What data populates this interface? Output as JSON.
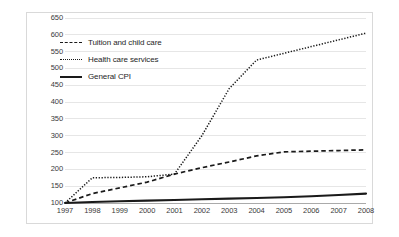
{
  "chart_data": {
    "type": "line",
    "title": "",
    "xlabel": "",
    "ylabel": "",
    "x": [
      1997,
      1998,
      1999,
      2000,
      2001,
      2002,
      2003,
      2004,
      2005,
      2006,
      2007,
      2008
    ],
    "categories": [
      "1997",
      "1998",
      "1999",
      "2000",
      "2001",
      "2002",
      "2003",
      "2004",
      "2005",
      "2006",
      "2007",
      "2008"
    ],
    "xlim": [
      1997,
      2008
    ],
    "ylim": [
      100,
      650
    ],
    "ytick_labels": [
      "100",
      "150",
      "200",
      "250",
      "300",
      "350",
      "400",
      "450",
      "500",
      "550",
      "600",
      "650"
    ],
    "ytick_values": [
      100,
      150,
      200,
      250,
      300,
      350,
      400,
      450,
      500,
      550,
      600,
      650
    ],
    "ytick_step": 50,
    "grid": true,
    "legend_position": "upper-left-inside",
    "series": [
      {
        "name": "Tuition and child care",
        "style": "dashed",
        "color": "#1a1a1a",
        "values": [
          100,
          128,
          145,
          162,
          186,
          205,
          222,
          240,
          252,
          254,
          256,
          258
        ]
      },
      {
        "name": "Health care services",
        "style": "dotted",
        "color": "#1a1a1a",
        "values": [
          100,
          175,
          176,
          178,
          186,
          300,
          440,
          525,
          545,
          565,
          585,
          605
        ]
      },
      {
        "name": "General CPI",
        "style": "solid",
        "color": "#1a1a1a",
        "values": [
          100,
          103,
          105,
          107,
          109,
          111,
          113,
          115,
          117,
          120,
          124,
          128
        ]
      }
    ]
  },
  "legend": {
    "items": [
      {
        "label": "Tuition and child care",
        "style": "dashed"
      },
      {
        "label": "Health care services",
        "style": "dotted"
      },
      {
        "label": "General CPI",
        "style": "solid"
      }
    ]
  }
}
